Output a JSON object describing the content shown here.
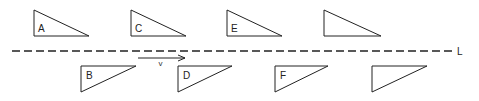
{
  "diagram": {
    "line": {
      "label": "L",
      "x1": 12,
      "x2": 452,
      "y": 51
    },
    "velocity": {
      "label": "v",
      "x1": 138,
      "x2": 185,
      "y": 58
    },
    "triangles_above": [
      {
        "label": "A",
        "points": [
          [
            34,
            10
          ],
          [
            34,
            36
          ],
          [
            89,
            36
          ]
        ],
        "label_pos": [
          38,
          32
        ]
      },
      {
        "label": "C",
        "points": [
          [
            131,
            10
          ],
          [
            131,
            36
          ],
          [
            186,
            36
          ]
        ],
        "label_pos": [
          135,
          32
        ]
      },
      {
        "label": "E",
        "points": [
          [
            227,
            10
          ],
          [
            227,
            36
          ],
          [
            282,
            36
          ]
        ],
        "label_pos": [
          231,
          32
        ]
      },
      {
        "label": "",
        "points": [
          [
            324,
            10
          ],
          [
            324,
            36
          ],
          [
            381,
            36
          ]
        ],
        "label_pos": [
          328,
          32
        ]
      }
    ],
    "triangles_below": [
      {
        "label": "B",
        "points": [
          [
            81,
            66
          ],
          [
            136,
            66
          ],
          [
            81,
            92
          ]
        ],
        "label_pos": [
          86,
          79
        ]
      },
      {
        "label": "D",
        "points": [
          [
            178,
            66
          ],
          [
            232,
            66
          ],
          [
            178,
            92
          ]
        ],
        "label_pos": [
          183,
          79
        ]
      },
      {
        "label": "F",
        "points": [
          [
            275,
            66
          ],
          [
            328,
            66
          ],
          [
            275,
            92
          ]
        ],
        "label_pos": [
          280,
          79
        ]
      },
      {
        "label": "",
        "points": [
          [
            372,
            66
          ],
          [
            427,
            66
          ],
          [
            372,
            92
          ]
        ],
        "label_pos": [
          377,
          79
        ]
      }
    ]
  }
}
